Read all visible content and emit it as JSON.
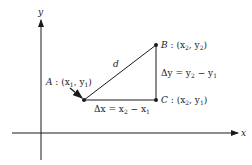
{
  "axes": {
    "x_label": "x",
    "y_label": "y"
  },
  "points": {
    "A": {
      "name": "A",
      "coords": "(x",
      "sub1": "1",
      "mid": ", y",
      "sub2": "1",
      "close": ")"
    },
    "B": {
      "name": "B",
      "coords": "(x",
      "sub1": "2",
      "mid": ", y",
      "sub2": "2",
      "close": ")"
    },
    "C": {
      "name": "C",
      "coords": "(x",
      "sub1": "2",
      "mid": ", y",
      "sub2": "1",
      "close": ")"
    }
  },
  "labels": {
    "distance": "d",
    "delta_x": {
      "lhs": "Δx = x",
      "s1": "2",
      "minus": " − x",
      "s2": "1"
    },
    "delta_y": {
      "lhs": "Δy = y",
      "s1": "2",
      "minus": " − y",
      "s2": "1"
    },
    "sep": " : "
  },
  "colors": {
    "ink": "#1a1a1a"
  }
}
